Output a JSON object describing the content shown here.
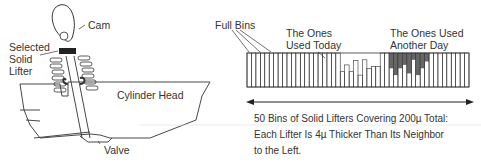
{
  "left_diagram": {
    "cam_label": "Cam",
    "lifter_label_lines": [
      "Selected",
      "Solid",
      "Lifter"
    ],
    "cylinder_head_label": "Cylinder Head",
    "valve_label": "Valve"
  },
  "right_diagram": {
    "full_bins_label": "Full Bins",
    "used_today_label_lines": [
      "The Ones",
      "Used Today"
    ],
    "used_another_day_label_lines": [
      "The Ones Used",
      "Another Day"
    ],
    "total_bins": 50,
    "bin_fill_levels": [
      1,
      1,
      1,
      1,
      1,
      1,
      1,
      1,
      1,
      1,
      1,
      1,
      1,
      1,
      1,
      1,
      1,
      1,
      1,
      1,
      1,
      0.45,
      0.65,
      0.45,
      0.78,
      0.35,
      0.8,
      0.55,
      0.6,
      0.6,
      1,
      1,
      1,
      1,
      1,
      1,
      1,
      1,
      1,
      1,
      1,
      1,
      1,
      1,
      1,
      1,
      1,
      1,
      1,
      1
    ],
    "used_today_bins": [
      21,
      22,
      23,
      24,
      25,
      26,
      27,
      28,
      29
    ],
    "used_another_day_bins": [
      32,
      33,
      34,
      35,
      36,
      37,
      38,
      39,
      40
    ],
    "another_day_fill_levels": [
      0.55,
      0.35,
      0.55,
      0.65,
      0.4,
      0.8,
      0.35,
      0.55,
      0.75
    ],
    "bin_fill_color": "#666666",
    "caption_lines": [
      "50 Bins of Solid Lifters Covering 200µ Total:",
      "Each Lifter Is 4µ Thicker Than Its Neighbor",
      "to the Left."
    ]
  }
}
